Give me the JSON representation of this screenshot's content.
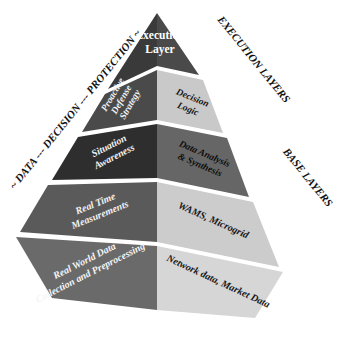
{
  "diagram": {
    "type": "3d-pyramid",
    "background_color": "#ffffff",
    "apex": {
      "label_line1": "Execution",
      "label_line2": "Layer",
      "fill": "#3a3a3a",
      "text_color": "#ffffff"
    },
    "left_face": {
      "axis_label": "~ DATA --- DECISION --- PROTECTION ~",
      "axis_label_color": "#111111",
      "tiers": [
        {
          "id": "left-tier-1",
          "lines": [
            "Proactive",
            "Defense",
            "Strategy"
          ],
          "fill": "#4a4a4a",
          "text_color": "#f2f2f2"
        },
        {
          "id": "left-tier-2",
          "lines": [
            "Situation",
            "Awareness"
          ],
          "fill": "#2e2e2e",
          "text_color": "#f2f2f2"
        },
        {
          "id": "left-tier-3",
          "lines": [
            "Real Time",
            "Measurements"
          ],
          "fill": "#5a5a5a",
          "text_color": "#f2f2f2"
        },
        {
          "id": "left-tier-4",
          "lines": [
            "Real World Data",
            "Collection and Preprocessing"
          ],
          "fill": "#6a6a6a",
          "text_color": "#f5f5f5"
        }
      ]
    },
    "right_face": {
      "axis_label_top": "EXECUTION LAYERS",
      "axis_label_bottom": "BASE LAYERS",
      "axis_label_color": "#111111",
      "tiers": [
        {
          "id": "right-tier-1",
          "lines": [
            "Decision",
            "Logic"
          ],
          "fill": "#c9c9c9",
          "text_color": "#161616"
        },
        {
          "id": "right-tier-2",
          "lines": [
            "Data Analysis",
            "& Synthesis"
          ],
          "fill": "#666666",
          "text_color": "#0d0d0d"
        },
        {
          "id": "right-tier-3",
          "lines": [
            "WAMS, Microgrid"
          ],
          "fill": "#cccccc",
          "text_color": "#161616"
        },
        {
          "id": "right-tier-4",
          "lines": [
            "Network data, Market Data"
          ],
          "fill": "#d6d6d6",
          "text_color": "#161616"
        }
      ]
    }
  }
}
